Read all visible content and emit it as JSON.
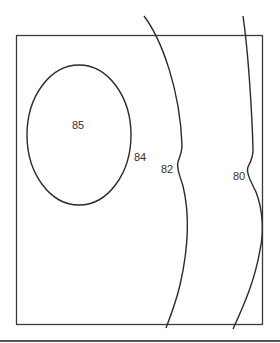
{
  "diagram": {
    "type": "contour-map",
    "contours": [
      {
        "value": "85",
        "shape": "closed-ellipse"
      },
      {
        "value": "84",
        "shape": "ellipse-boundary-label"
      },
      {
        "value": "82",
        "shape": "open-curve"
      },
      {
        "value": "80",
        "shape": "open-curve"
      }
    ],
    "labels": {
      "c85": "85",
      "c84": "84",
      "c82": "82",
      "c80": "80"
    },
    "colors": {
      "line": "#2a2a2a",
      "background": "#ffffff"
    }
  }
}
